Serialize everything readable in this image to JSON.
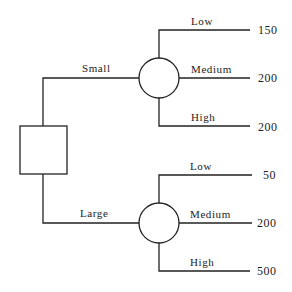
{
  "diagram": {
    "type": "decision-tree",
    "decision_node": {
      "shape": "square"
    },
    "branches": [
      {
        "label": "Small",
        "chance_node": {
          "shape": "circle"
        },
        "outcomes": [
          {
            "label": "Low",
            "value": "150"
          },
          {
            "label": "Medium",
            "value": "200"
          },
          {
            "label": "High",
            "value": "200"
          }
        ]
      },
      {
        "label": "Large",
        "chance_node": {
          "shape": "circle"
        },
        "outcomes": [
          {
            "label": "Low",
            "value": "50"
          },
          {
            "label": "Medium",
            "value": "200"
          },
          {
            "label": "High",
            "value": "500"
          }
        ]
      }
    ],
    "colors": {
      "line": "#222222",
      "background": "#ffffff"
    }
  }
}
